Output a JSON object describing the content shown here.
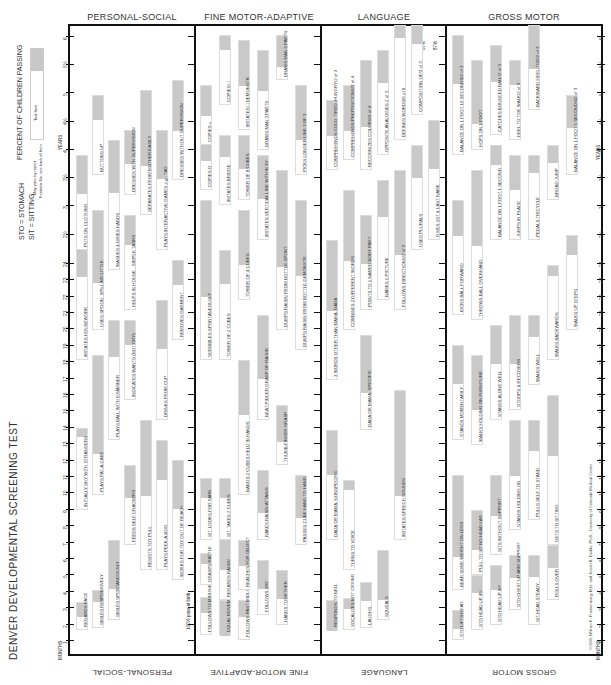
{
  "document": {
    "title": "DENVER DEVELOPMENTAL SCREENING TEST",
    "abbrev_1": "STO = STOMACH",
    "abbrev_2": "SIT = SITTING",
    "legend_title": "PERCENT OF CHILDREN PASSING",
    "legend_ticks": [
      "25",
      "50",
      "75",
      "90"
    ],
    "legend_item": "Test Item",
    "legend_may_pass": "May pass by report",
    "legend_footnote": "Footnote No. see back of form",
    "copyright": "©1969, William K. Frankenburg, M.D. and Josiah B. Dodds, Ph.D., University of Colorado Medical Center",
    "months_label": "MONTHS",
    "years_label": "YEARS",
    "birth_note": "100% pass at birth",
    "pct_50": "50%",
    "pct_87a": "87%",
    "pct_87b": "87%"
  },
  "sections": {
    "personal_social": "PERSONAL-SOCIAL",
    "fine_motor": "FINE MOTOR-ADAPTIVE",
    "language": "LANGUAGE",
    "gross_motor": "GROSS MOTOR"
  },
  "age_axis": {
    "months": [
      "1",
      "2",
      "3",
      "4",
      "5",
      "6",
      "7",
      "8",
      "9",
      "10",
      "11",
      "12",
      "13",
      "14",
      "15",
      "16",
      "17",
      "18",
      "19",
      "20",
      "21",
      "22",
      "23",
      "24"
    ],
    "years": [
      "2½",
      "3",
      "3½",
      "4",
      "4½",
      "5",
      "5½",
      "6"
    ]
  },
  "items": {
    "personal_social": [
      {
        "label": "REGARDS FACE",
        "col": 0,
        "y0": 630,
        "y1": 602,
        "s": 0.5
      },
      {
        "label": "SMILES RESPONSIVELY",
        "col": 1,
        "y0": 628,
        "y1": 590,
        "s": 0.3
      },
      {
        "label": "SMILES SPONTANEOUSLY",
        "col": 2,
        "y0": 620,
        "y1": 540,
        "s": 0.6
      },
      {
        "label": "INITIALLY SHY WITH STRANGERS",
        "col": 0,
        "y0": 510,
        "y1": 428,
        "s": 0.1
      },
      {
        "label": "PLAYS PAT-A-CAKE",
        "col": 1,
        "y0": 495,
        "y1": 355,
        "s": 0.7
      },
      {
        "label": "PLAYS BALL WITH EXAMINER",
        "col": 2,
        "y0": 440,
        "y1": 320,
        "s": 0.3
      },
      {
        "label": "FEEDS SELF CRACKERS",
        "col": 3,
        "y0": 545,
        "y1": 465,
        "s": 0.4
      },
      {
        "label": "RESISTS TOY PULL",
        "col": 4,
        "y0": 570,
        "y1": 420,
        "s": 0.5
      },
      {
        "label": "PLAYS PEEK-A-BOO",
        "col": 5,
        "y0": 570,
        "y1": 440,
        "s": 0.3
      },
      {
        "label": "WORKS FOR TOY OUT OF REACH",
        "col": 6,
        "y0": 580,
        "y1": 460,
        "s": 0.4
      },
      {
        "label": "IMITATES HOUSEWORK",
        "col": 0,
        "y0": 360,
        "y1": 240,
        "s": 0.3
      },
      {
        "label": "USES SPOON, SPILLING LITTLE",
        "col": 1,
        "y0": 330,
        "y1": 210,
        "s": 0.6
      },
      {
        "label": "INDICATES WANTS (NOT CRY)",
        "col": 3,
        "y0": 400,
        "y1": 320,
        "s": 0.3
      },
      {
        "label": "DRINKS FROM CUP",
        "col": 5,
        "y0": 420,
        "y1": 300,
        "s": 0.4
      },
      {
        "label": "REMOVES GARMENT",
        "col": 6,
        "y0": 340,
        "y1": 260,
        "s": 0.3
      },
      {
        "label": "HELPS IN HOUSE - SIMPLE TASKS",
        "col": 3,
        "y0": 310,
        "y1": 215,
        "s": 0.3
      },
      {
        "label": "WASHES & DRIES HANDS",
        "col": 2,
        "y0": 270,
        "y1": 140,
        "s": 0.4
      },
      {
        "label": "PUTS ON CLOTHING",
        "col": 0,
        "y0": 250,
        "y1": 155,
        "s": 0.4
      },
      {
        "label": "BUTTONS UP",
        "col": 1,
        "y0": 175,
        "y1": 95,
        "s": 0.3
      },
      {
        "label": "DRESSES WITH SUPERVISION",
        "col": 3,
        "y0": 195,
        "y1": 130,
        "s": 0.5
      },
      {
        "label": "SEPARATES FROM MOTHER EASILY",
        "col": 4,
        "y0": 215,
        "y1": 90,
        "s": 0.6
      },
      {
        "label": "PLAYS INTERACTIVE GAMES e.g., TAG",
        "col": 5,
        "y0": 250,
        "y1": 130,
        "s": 0.4
      },
      {
        "label": "DRESSES WITHOUT SUPERVISION",
        "col": 6,
        "y0": 180,
        "y1": 80,
        "s": 0.5
      }
    ],
    "fine_motor": [
      {
        "label": "FOLLOWS TO MIDLINE",
        "col": 0,
        "y0": 635,
        "y1": 597,
        "s": 0.4
      },
      {
        "label": "EQUAL MOVEMENTS",
        "col": 1,
        "y0": 635,
        "y1": 600,
        "s": 1.0
      },
      {
        "label": "FOLLOWS PAST MIDLINE",
        "col": 2,
        "y0": 640,
        "y1": 600,
        "s": 0.4
      },
      {
        "label": "GRASPS RATTLE",
        "col": 0,
        "y0": 585,
        "y1": 553,
        "s": 0.3
      },
      {
        "label": "REGARDS RAISIN",
        "col": 1,
        "y0": 600,
        "y1": 538,
        "s": 0.5
      },
      {
        "label": "REACHES FOR OBJECT",
        "col": 2,
        "y0": 590,
        "y1": 540,
        "s": 0.5
      },
      {
        "label": "FOLLOWS 180°",
        "col": 3,
        "y0": 615,
        "y1": 560,
        "s": 0.5
      },
      {
        "label": "HANDS TOGETHER",
        "col": 4,
        "y0": 625,
        "y1": 570,
        "s": 0.5
      },
      {
        "label": "SIT. LOOKS FOR YARN",
        "col": 0,
        "y0": 540,
        "y1": 478,
        "s": 0.3
      },
      {
        "label": "SIT. TAKES 2 CUBES",
        "col": 1,
        "y0": 540,
        "y1": 478,
        "s": 0.3
      },
      {
        "label": "RAKES RAISIN ATTAINS",
        "col": 3,
        "y0": 540,
        "y1": 470,
        "s": 0.6
      },
      {
        "label": "PASSES CUBE HAND TO HAND",
        "col": 5,
        "y0": 545,
        "y1": 475,
        "s": 0.6
      },
      {
        "label": "BANGS 2 CUBES HELD IN HANDS",
        "col": 2,
        "y0": 495,
        "y1": 360,
        "s": 0.4
      },
      {
        "label": "THUMB-FINGER GRASP",
        "col": 4,
        "y0": 465,
        "y1": 405,
        "s": 0.6
      },
      {
        "label": "NEAT PINCER GRASP OF RAISIN",
        "col": 3,
        "y0": 420,
        "y1": 315,
        "s": 0.6
      },
      {
        "label": "SCRIBBLES SPONTANEOUSLY",
        "col": 0,
        "y0": 360,
        "y1": 200,
        "s": 0.6
      },
      {
        "label": "TOWER OF 2 CUBES",
        "col": 1,
        "y0": 360,
        "y1": 250,
        "s": 0.3
      },
      {
        "label": "TOWER OF 4 CUBES",
        "col": 2,
        "y0": 300,
        "y1": 210,
        "s": 0.6
      },
      {
        "label": "DUMPS RAISIN FROM BOTTLE-SPONT.",
        "col": 4,
        "y0": 330,
        "y1": 170,
        "s": 0.6
      },
      {
        "label": "DUMPS RAISIN FROM BOTTLE-DEMONSTR.",
        "col": 5,
        "y0": 350,
        "y1": 200,
        "s": 0.5
      },
      {
        "label": "TOWER OF 8 CUBES",
        "col": 2,
        "y0": 200,
        "y1": 135,
        "s": 0.5
      },
      {
        "label": "IMITATES VERTICAL LINE WITHIN 30°",
        "col": 3,
        "y0": 240,
        "y1": 155,
        "s": 0.5
      },
      {
        "label": "COPIES O",
        "col": 0,
        "y0": 190,
        "y1": 140,
        "s": 0.4
      },
      {
        "label": "IMITATES BRIDGE",
        "col": 1,
        "y0": 205,
        "y1": 135,
        "s": 0.3
      },
      {
        "label": "COPIES +",
        "col": 0,
        "y0": 145,
        "y1": 85,
        "s": 0.5
      },
      {
        "label": "PICKS LONGER LINE 3 OF 3",
        "col": 5,
        "y0": 175,
        "y1": 85,
        "s": 0.6
      },
      {
        "label": "COPIES □",
        "col": 1,
        "y0": 105,
        "y1": 35,
        "s": 0.2
      },
      {
        "label": "IMITATES □ DEMONSTR.",
        "col": 2,
        "y0": 130,
        "y1": 40,
        "s": 0.5
      },
      {
        "label": "DRAWS MAN 3 PARTS",
        "col": 3,
        "y0": 150,
        "y1": 50,
        "s": 0.4
      },
      {
        "label": "DRAWS MAN 6 PARTS",
        "col": 4,
        "y0": 80,
        "y1": 35,
        "s": 0.7
      }
    ],
    "language": [
      {
        "label": "RESPONDS TO BELL",
        "col": 0,
        "y0": 630,
        "y1": 600,
        "s": 1.0
      },
      {
        "label": "VOCALIZES NOT CRYING",
        "col": 1,
        "y0": 630,
        "y1": 598,
        "s": 0.3
      },
      {
        "label": "LAUGHS",
        "col": 2,
        "y0": 628,
        "y1": 582,
        "s": 0.4
      },
      {
        "label": "SQUEALS",
        "col": 3,
        "y0": 620,
        "y1": 550,
        "s": 0.7
      },
      {
        "label": "TURNS TO VOICE",
        "col": 1,
        "y0": 570,
        "y1": 480,
        "s": 0.1
      },
      {
        "label": "DADA OR MAMA, NONSPECIFIC",
        "col": 0,
        "y0": 540,
        "y1": 430,
        "s": 0.4
      },
      {
        "label": "IMITATES SPEECH SOUNDS",
        "col": 4,
        "y0": 540,
        "y1": 390,
        "s": 0.7
      },
      {
        "label": "DADA OR MAMA, SPECIFIC",
        "col": 2,
        "y0": 430,
        "y1": 335,
        "s": 0.6
      },
      {
        "label": "3 WORDS OTHER THAN MAMA, DADA",
        "col": 0,
        "y0": 380,
        "y1": 240,
        "s": 0.5
      },
      {
        "label": "COMBINES 2 DIFFERENT WORDS",
        "col": 1,
        "y0": 330,
        "y1": 190,
        "s": 0.5
      },
      {
        "label": "POINTS TO 1 NAMED BODY PART",
        "col": 2,
        "y0": 310,
        "y1": 215,
        "s": 0.5
      },
      {
        "label": "NAMES 1 PICTURE",
        "col": 3,
        "y0": 300,
        "y1": 180,
        "s": 0.3
      },
      {
        "label": "FOLLOWS DIRECTIONS/2 of 3",
        "col": 4,
        "y0": 310,
        "y1": 170,
        "s": 0.6
      },
      {
        "label": "USES PLURALS",
        "col": 5,
        "y0": 250,
        "y1": 145,
        "s": 0.3
      },
      {
        "label": "COMPREHENDS COLD, TIRED, HUNGRY/2 of 3",
        "col": 0,
        "y0": 170,
        "y1": 100,
        "s": 0.5
      },
      {
        "label": "COMPREHENDS PREPOSITIONS/3 of 4",
        "col": 1,
        "y0": 160,
        "y1": 85,
        "s": 0.6
      },
      {
        "label": "RECOGNIZES COLORS/3 of 4",
        "col": 2,
        "y0": 170,
        "y1": 60,
        "s": 0.6
      },
      {
        "label": "OPPOSITE ANALOGIES 2 of 3",
        "col": 3,
        "y0": 155,
        "y1": 50,
        "s": 0.3
      },
      {
        "label": "GIVES 1ST & LAST NAME",
        "col": 6,
        "y0": 240,
        "y1": 120,
        "s": 0.4
      },
      {
        "label": "DEFINES WORDS/6 of 9",
        "col": 4,
        "y0": 140,
        "y1": 25,
        "s": 0.1
      },
      {
        "label": "COMPOSITION OF/3 of 3",
        "col": 5,
        "y0": 115,
        "y1": 25,
        "s": 0.2
      }
    ],
    "gross_motor": [
      {
        "label": "STO LIFTS HEAD",
        "col": 0,
        "y0": 640,
        "y1": 610,
        "s": 0.6
      },
      {
        "label": "STO HEAD UP 45°",
        "col": 1,
        "y0": 630,
        "y1": 575,
        "s": 0.3
      },
      {
        "label": "STO HEAD UP 90°",
        "col": 2,
        "y0": 625,
        "y1": 565,
        "s": 0.4
      },
      {
        "label": "SIT-HEAD STEADY",
        "col": 4,
        "y0": 625,
        "y1": 555,
        "s": 0.3
      },
      {
        "label": "STO CHEST UP ARM SUPPORT",
        "col": 3,
        "y0": 610,
        "y1": 555,
        "s": 0.4
      },
      {
        "label": "ROLLS OVER",
        "col": 5,
        "y0": 600,
        "y1": 545,
        "s": 0.4
      },
      {
        "label": "BEAR SOME WEIGHT ON LEGS",
        "col": 0,
        "y0": 590,
        "y1": 475,
        "s": 0.7
      },
      {
        "label": "PULL TO SIT NO HEAD LAG",
        "col": 1,
        "y0": 575,
        "y1": 510,
        "s": 0.6
      },
      {
        "label": "SITS WITHOUT SUPPORT",
        "col": 2,
        "y0": 555,
        "y1": 475,
        "s": 0.5
      },
      {
        "label": "STANDS HOLDING ON",
        "col": 3,
        "y0": 530,
        "y1": 420,
        "s": 0.5
      },
      {
        "label": "PULLS SELF TO STAND",
        "col": 4,
        "y0": 520,
        "y1": 420,
        "s": 0.3
      },
      {
        "label": "GETS TO SITTING",
        "col": 5,
        "y0": 545,
        "y1": 395,
        "s": 0.4
      },
      {
        "label": "STANDS MOMENTARILY",
        "col": 0,
        "y0": 440,
        "y1": 345,
        "s": 0.4
      },
      {
        "label": "WALKS HOLDING ON FURNITURE",
        "col": 1,
        "y0": 445,
        "y1": 355,
        "s": 0.6
      },
      {
        "label": "STANDS ALONE WELL",
        "col": 2,
        "y0": 420,
        "y1": 325,
        "s": 0.4
      },
      {
        "label": "STOOPS & RECOVERS",
        "col": 3,
        "y0": 410,
        "y1": 315,
        "s": 0.5
      },
      {
        "label": "WALKS WELL",
        "col": 4,
        "y0": 385,
        "y1": 315,
        "s": 0.3
      },
      {
        "label": "WALKS BACKWARDS",
        "col": 5,
        "y0": 360,
        "y1": 265,
        "s": 0.1
      },
      {
        "label": "KICKS BALL FORWARD",
        "col": 0,
        "y0": 315,
        "y1": 200,
        "s": 0.3
      },
      {
        "label": "THROWS BALL OVERHAND",
        "col": 1,
        "y0": 320,
        "y1": 170,
        "s": 0.5
      },
      {
        "label": "WALKS UP STEPS",
        "col": 6,
        "y0": 330,
        "y1": 235,
        "s": 0.2
      },
      {
        "label": "BALANCE ON 1 FOOT 1 SECOND",
        "col": 2,
        "y0": 240,
        "y1": 145,
        "s": 0.2
      },
      {
        "label": "JUMPS IN PLACE",
        "col": 3,
        "y0": 240,
        "y1": 155,
        "s": 0.4
      },
      {
        "label": "PEDALS TRICYCLE",
        "col": 4,
        "y0": 240,
        "y1": 155,
        "s": 0.2
      },
      {
        "label": "BROAD JUMP",
        "col": 5,
        "y0": 200,
        "y1": 145,
        "s": 0.3
      },
      {
        "label": "BALANCE ON 1 FOOT 5 SECONDS/2 of 3",
        "col": 6,
        "y0": 175,
        "y1": 95,
        "s": 0.4
      },
      {
        "label": "BALANCE ON 1 FOOT 10 SECONDS/2 of 3",
        "col": 0,
        "y0": 155,
        "y1": 35,
        "s": 0.4
      },
      {
        "label": "HOPS ON 1 FOOT",
        "col": 1,
        "y0": 150,
        "y1": 60,
        "s": 0.7
      },
      {
        "label": "CATCHES BOUNCED BALL/2 of 3",
        "col": 2,
        "y0": 135,
        "y1": 45,
        "s": 0.4
      },
      {
        "label": "HEEL TO TOE WALK/2 of 3",
        "col": 3,
        "y0": 140,
        "y1": 60,
        "s": 0.3
      },
      {
        "label": "BACKWARD HEEL-TOE/2 of 3",
        "col": 4,
        "y0": 110,
        "y1": 25,
        "s": 0.5
      }
    ]
  }
}
